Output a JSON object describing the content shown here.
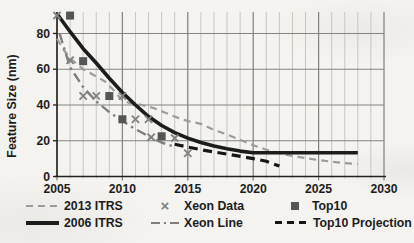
{
  "figure": {
    "background": "#f4f3f0",
    "axis_color": "#222222",
    "grid_minor_color": "#c7c6c2",
    "grid_major_color": "#84837f",
    "text_color": "#1d1d1c"
  },
  "chart_data": {
    "type": "line",
    "title": "",
    "xlabel": "",
    "ylabel": "Feature Size (nm)",
    "xlim": [
      2005,
      2030
    ],
    "ylim": [
      0,
      92
    ],
    "x_ticks": [
      2005,
      2010,
      2015,
      2020,
      2025,
      2030
    ],
    "x_minor_step": 1,
    "y_ticks": [
      0,
      20,
      40,
      60,
      80
    ],
    "grid": true,
    "legend_position": "bottom",
    "series": [
      {
        "name": "2013 ITRS",
        "type": "line",
        "style": "dashed",
        "color": "#9b9b9b",
        "width": 2.2,
        "dash": "7 5",
        "points": [
          [
            2005,
            77
          ],
          [
            2005.5,
            71
          ],
          [
            2006,
            66
          ],
          [
            2007,
            60
          ],
          [
            2008,
            56
          ],
          [
            2008.7,
            53
          ],
          [
            2009.3,
            48.5
          ],
          [
            2010,
            42.5
          ],
          [
            2010.6,
            41
          ],
          [
            2011.5,
            40
          ],
          [
            2012.3,
            38.5
          ],
          [
            2013,
            36.5
          ],
          [
            2014,
            33.5
          ],
          [
            2015,
            31
          ],
          [
            2016,
            29.5
          ],
          [
            2017,
            26
          ],
          [
            2018,
            23.5
          ],
          [
            2019,
            20.5
          ],
          [
            2020,
            17.5
          ],
          [
            2021,
            15
          ],
          [
            2022,
            13
          ],
          [
            2023,
            11.5
          ],
          [
            2024,
            10.3
          ],
          [
            2025,
            9.2
          ],
          [
            2026,
            8.3
          ],
          [
            2027,
            7.5
          ],
          [
            2028,
            7
          ]
        ]
      },
      {
        "name": "Xeon Data",
        "type": "scatter",
        "marker": "x",
        "glyph": "×",
        "color": "#828282",
        "points": [
          [
            2005,
            90
          ],
          [
            2006,
            65
          ],
          [
            2007,
            45
          ],
          [
            2008,
            45
          ],
          [
            2010,
            45
          ],
          [
            2011,
            32
          ],
          [
            2012,
            32
          ],
          [
            2012.2,
            22
          ],
          [
            2014,
            21.5
          ],
          [
            2015,
            13
          ]
        ]
      },
      {
        "name": "Top10",
        "type": "scatter",
        "marker": "square",
        "color": "#555555",
        "points": [
          [
            2006,
            90
          ],
          [
            2007,
            64.5
          ],
          [
            2009,
            45
          ],
          [
            2010,
            32
          ],
          [
            2013,
            22.5
          ]
        ]
      },
      {
        "name": "2006 ITRS",
        "type": "line",
        "style": "solid",
        "color": "#1c1c1c",
        "width": 3.6,
        "points": [
          [
            2005,
            91
          ],
          [
            2006,
            81
          ],
          [
            2007,
            71.5
          ],
          [
            2008,
            63.5
          ],
          [
            2009,
            55
          ],
          [
            2010,
            47
          ],
          [
            2011,
            40
          ],
          [
            2012,
            33.5
          ],
          [
            2013,
            28.5
          ],
          [
            2014,
            24.5
          ],
          [
            2015,
            21.5
          ],
          [
            2016,
            19
          ],
          [
            2017,
            17
          ],
          [
            2018,
            15.5
          ],
          [
            2019,
            14.2
          ],
          [
            2020,
            13.3
          ],
          [
            2028,
            13.3
          ]
        ]
      },
      {
        "name": "Xeon Line",
        "type": "line",
        "style": "dashdot",
        "color": "#7e7e7e",
        "width": 2.4,
        "dash": "10 4.5 2.4 4.5",
        "points": [
          [
            2005.2,
            80
          ],
          [
            2006,
            61
          ],
          [
            2007,
            50
          ],
          [
            2008,
            42
          ],
          [
            2009,
            36
          ],
          [
            2010,
            31
          ],
          [
            2011,
            26.5
          ],
          [
            2012,
            22.5
          ],
          [
            2013,
            19
          ],
          [
            2014,
            16.5
          ]
        ]
      },
      {
        "name": "Top10 Projection",
        "type": "line",
        "style": "dashed",
        "color": "#161616",
        "width": 3.2,
        "dash": "9 5.5",
        "points": [
          [
            2014,
            18
          ],
          [
            2016,
            15
          ],
          [
            2018,
            12.5
          ],
          [
            2020,
            10
          ],
          [
            2021,
            8.5
          ],
          [
            2022,
            5.8
          ]
        ]
      }
    ]
  }
}
